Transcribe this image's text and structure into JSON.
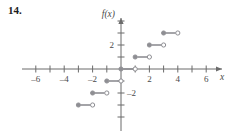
{
  "problem": {
    "number": "14."
  },
  "chart_data": {
    "type": "line",
    "title": "",
    "subtitle": "",
    "xlabel": "x",
    "ylabel": "f(x)",
    "xlim": [
      -7.2,
      7.0
    ],
    "ylim": [
      -4.2,
      4.4
    ],
    "grid": false,
    "legend": null,
    "x_ticks": [
      -7,
      -6,
      -5,
      -4,
      -3,
      -2,
      -1,
      1,
      2,
      3,
      4,
      5,
      6
    ],
    "x_tick_labels": [
      {
        "value": -6,
        "text": "–6"
      },
      {
        "value": -4,
        "text": "–4"
      },
      {
        "value": -2,
        "text": "–2"
      },
      {
        "value": 2,
        "text": "2"
      },
      {
        "value": 4,
        "text": "4"
      },
      {
        "value": 6,
        "text": "6"
      }
    ],
    "y_ticks": [
      -4,
      -3,
      -2,
      -1,
      1,
      2,
      3,
      4
    ],
    "y_tick_labels": [
      {
        "value": 2,
        "text": "2"
      },
      {
        "value": -2,
        "text": "–2"
      }
    ],
    "segments": [
      {
        "x_start": -3,
        "x_end": -2,
        "y": -3,
        "left_endpoint": "closed",
        "right_endpoint": "open"
      },
      {
        "x_start": -2,
        "x_end": -1,
        "y": -2,
        "left_endpoint": "closed",
        "right_endpoint": "open"
      },
      {
        "x_start": -1,
        "x_end": 0,
        "y": -1,
        "left_endpoint": "closed",
        "right_endpoint": "open"
      },
      {
        "x_start": 0,
        "x_end": 1,
        "y": 0,
        "left_endpoint": "closed",
        "right_endpoint": "open"
      },
      {
        "x_start": 1,
        "x_end": 2,
        "y": 1,
        "left_endpoint": "closed",
        "right_endpoint": "open"
      },
      {
        "x_start": 2,
        "x_end": 3,
        "y": 2,
        "left_endpoint": "closed",
        "right_endpoint": "open"
      },
      {
        "x_start": 3,
        "x_end": 4,
        "y": 3,
        "left_endpoint": "closed",
        "right_endpoint": "open"
      }
    ],
    "colors": {
      "axis": "#6b6b6b",
      "curve": "#8e8e93",
      "endpoint_fill": "#8e8e93",
      "endpoint_open": "#ffffff",
      "text": "#4a4a4a"
    }
  }
}
